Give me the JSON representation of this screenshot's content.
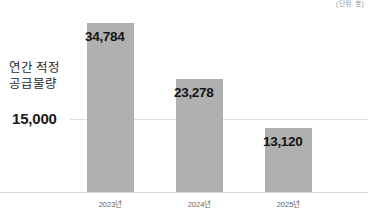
{
  "unit_note": "(단위: 호)",
  "side_annotation": "연간 적정\n공급물량",
  "threshold_label": "15,000",
  "colors": {
    "bar_fill": "#b0b0b0",
    "threshold_line": "#dcdcdc",
    "axis_line": "#d8d8d8",
    "value_text": "#141414",
    "category_text": "#666666",
    "background": "#ffffff"
  },
  "chart_data": {
    "type": "bar",
    "title": "",
    "subtitle": "",
    "xlabel": "",
    "ylabel": "",
    "unit": "(단위: 호)",
    "categories": [
      "2023년",
      "2024년",
      "2025년"
    ],
    "values": [
      34784,
      23278,
      13120
    ],
    "value_labels": [
      "34,784",
      "23,278",
      "13,120"
    ],
    "series": [
      {
        "name": "연간 적정 공급물량",
        "values": [
          34784,
          23278,
          13120
        ]
      }
    ],
    "ylim": [
      0,
      38000
    ],
    "grid": false,
    "legend": false,
    "legend_position": "none",
    "annotations": [
      {
        "type": "threshold_line",
        "label": "15,000",
        "value": 15000,
        "orientation": "horizontal"
      },
      {
        "type": "text",
        "label": "연간 적정 공급물량",
        "position": "left"
      }
    ]
  }
}
